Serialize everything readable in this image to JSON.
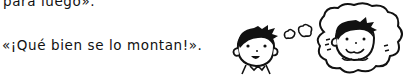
{
  "text": {
    "line1": "para luego».",
    "line2": "«¡Qué bien se lo montan!»."
  },
  "illustration": {
    "boy": "boy-face-icon",
    "thought_bubble": "thought-bubble-icon",
    "dreaming_boy": "boy-smiling-face-icon"
  }
}
